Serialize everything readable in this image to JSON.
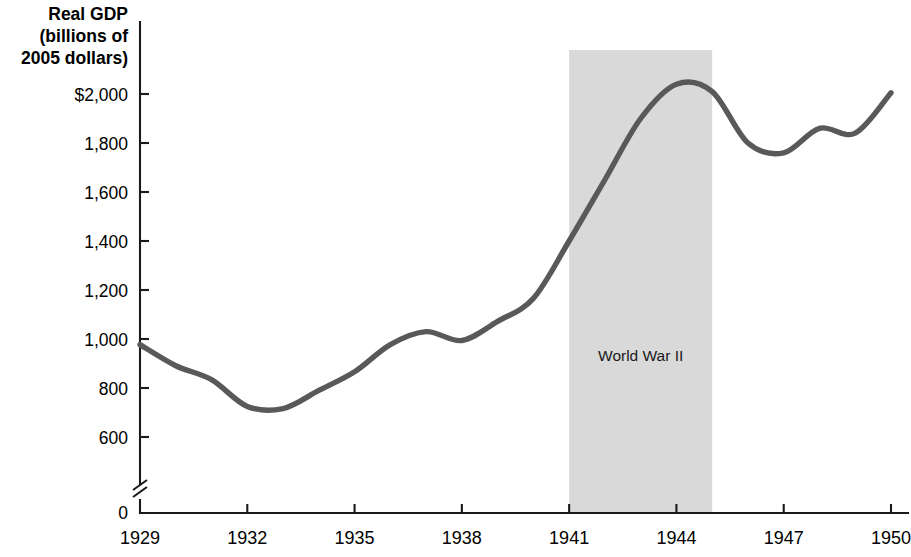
{
  "chart_data": {
    "type": "line",
    "title": "",
    "ylabel": "Real GDP\n(billions of\n2005 dollars)",
    "ylabel_lines": [
      "Real GDP",
      "(billions of",
      "2005 dollars)"
    ],
    "xlabel": "",
    "xlim": [
      1929,
      1950
    ],
    "ylim": [
      600,
      2100
    ],
    "y_axis_break": true,
    "y_axis_break_from": 0,
    "grid": false,
    "legend": "none",
    "yticks": [
      600,
      800,
      1000,
      1200,
      1400,
      1600,
      1800,
      2000
    ],
    "ytick_labels": [
      "600",
      "800",
      "1,000",
      "1,200",
      "1,400",
      "1,600",
      "1,800",
      "$2,000"
    ],
    "y_zero_label": "0",
    "xticks": [
      1929,
      1932,
      1935,
      1938,
      1941,
      1944,
      1947,
      1950
    ],
    "xtick_labels": [
      "1929",
      "1932",
      "1935",
      "1938",
      "1941",
      "1944",
      "1947",
      "1950"
    ],
    "series": [
      {
        "name": "Real GDP",
        "color": "#595959",
        "x": [
          1929,
          1930,
          1931,
          1932,
          1933,
          1934,
          1935,
          1936,
          1937,
          1938,
          1939,
          1940,
          1941,
          1942,
          1943,
          1944,
          1945,
          1946,
          1947,
          1948,
          1949,
          1950
        ],
        "values": [
          977,
          891,
          834,
          725,
          716,
          790,
          866,
          977,
          1030,
          994,
          1072,
          1166,
          1400,
          1650,
          1900,
          2040,
          2010,
          1800,
          1760,
          1860,
          1840,
          2005
        ]
      }
    ],
    "annotations": [
      {
        "type": "span-band",
        "label": "World War II",
        "x_start": 1941,
        "x_end": 1945,
        "color": "#d9d9d9",
        "label_x": 1943,
        "label_y": 910
      }
    ]
  }
}
